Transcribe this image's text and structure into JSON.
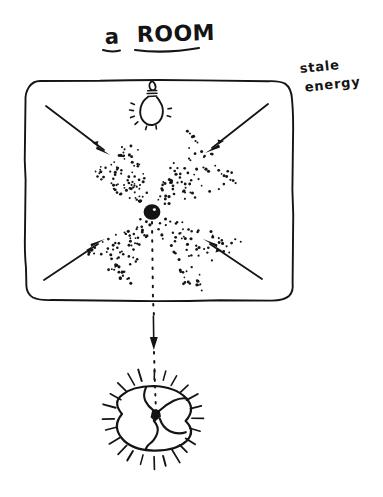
{
  "canvas": {
    "width": 383,
    "height": 497,
    "background_color": "#ffffff",
    "ink_color": "#141414",
    "style": "hand-drawn pen sketch"
  },
  "title": {
    "article": "a",
    "noun": "ROOM",
    "full": "a ROOM",
    "underlined": true
  },
  "annotations": [
    {
      "name": "stale-energy-label",
      "line1": "stale",
      "line2": "energy",
      "full": "stale energy",
      "x": 300,
      "y": 68
    }
  ],
  "room": {
    "shape": "rounded-rectangle",
    "x": 25,
    "y": 80,
    "width": 268,
    "height": 220,
    "corner_radius": 14
  },
  "lamp": {
    "name": "ceiling-light-bulb",
    "center_x": 152,
    "center_y": 103,
    "bulb_width": 20,
    "bulb_height": 26,
    "ray_count": 7,
    "lit": true
  },
  "center_node": {
    "name": "energy-convergence-point",
    "x": 152,
    "y": 212,
    "radius": 8,
    "filled": true
  },
  "arrows": [
    {
      "name": "arrow-top-left",
      "x1": 48,
      "y1": 107,
      "x2": 108,
      "y2": 152,
      "direction": "down-right"
    },
    {
      "name": "arrow-top-right",
      "x1": 268,
      "y1": 105,
      "x2": 208,
      "y2": 150,
      "direction": "down-left"
    },
    {
      "name": "arrow-bottom-left",
      "x1": 46,
      "y1": 278,
      "x2": 104,
      "y2": 240,
      "direction": "up-right"
    },
    {
      "name": "arrow-bottom-right",
      "x1": 262,
      "y1": 277,
      "x2": 206,
      "y2": 240,
      "direction": "up-left"
    }
  ],
  "stipple_cones": [
    {
      "name": "stipple-cone-upper-left",
      "from_x": 112,
      "from_y": 158,
      "to_x": 148,
      "to_y": 206,
      "dots": 78
    },
    {
      "name": "stipple-cone-upper-right",
      "from_x": 212,
      "from_y": 156,
      "to_x": 158,
      "to_y": 206,
      "dots": 78
    },
    {
      "name": "stipple-cone-lower-left",
      "from_x": 110,
      "from_y": 268,
      "to_x": 148,
      "to_y": 220,
      "dots": 72
    },
    {
      "name": "stipple-cone-lower-right",
      "from_x": 214,
      "from_y": 268,
      "to_x": 158,
      "to_y": 220,
      "dots": 72
    }
  ],
  "exit_path": {
    "name": "dotted-exit-line",
    "from_x": 152,
    "from_y": 222,
    "to_x": 155,
    "to_y": 386,
    "style": "dotted",
    "arrow": {
      "x": 153,
      "y1": 313,
      "y2": 348,
      "direction": "down"
    }
  },
  "radiant_circle": {
    "name": "released-energy-symbol",
    "center_x": 153,
    "center_y": 418,
    "radius": 32,
    "ray_count": 24,
    "ray_inner": 38,
    "ray_outer": 50,
    "inner_figure": "hourglass",
    "pinch_filled": true
  }
}
